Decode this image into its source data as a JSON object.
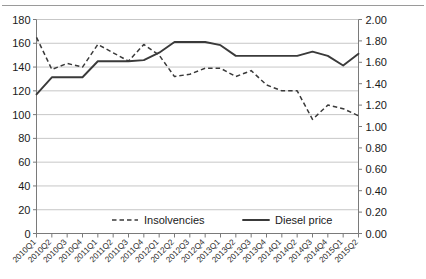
{
  "chart_data": {
    "type": "line",
    "title": "",
    "xlabel": "",
    "ylabel": "",
    "grid": true,
    "legend_position": "bottom-center",
    "categories": [
      "2010Q1",
      "2010Q2",
      "2010Q3",
      "2010Q4",
      "2011Q1",
      "2011Q2",
      "2011Q3",
      "2011Q4",
      "2012Q1",
      "2012Q2",
      "2012Q3",
      "2012Q4",
      "2013Q1",
      "2013Q2",
      "2013Q3",
      "2013Q4",
      "2014Q1",
      "2014Q2",
      "2014Q3",
      "2014Q4",
      "2015Q1",
      "2015Q2"
    ],
    "axes": {
      "left": {
        "label": "",
        "min": 0,
        "max": 180,
        "step": 20,
        "ticks": [
          "0",
          "20",
          "40",
          "60",
          "80",
          "100",
          "120",
          "140",
          "160",
          "180"
        ]
      },
      "right": {
        "label": "",
        "min": 0.0,
        "max": 2.0,
        "step": 0.2,
        "ticks": [
          "0.00",
          "0.20",
          "0.40",
          "0.60",
          "0.80",
          "1.00",
          "1.20",
          "1.40",
          "1.60",
          "1.80",
          "2.00"
        ]
      }
    },
    "series": [
      {
        "name": "Insolvencies",
        "axis": "left",
        "style": "dashed",
        "color": "#3a3a3a",
        "values": [
          165,
          138,
          143,
          140,
          159,
          152,
          145,
          159,
          150,
          132,
          134,
          139,
          139,
          132,
          137,
          125,
          120,
          120,
          96,
          108,
          105,
          99
        ]
      },
      {
        "name": "Diesel price",
        "axis": "right",
        "style": "solid",
        "color": "#3a3a3a",
        "values": [
          1.3,
          1.46,
          1.46,
          1.46,
          1.61,
          1.61,
          1.61,
          1.62,
          1.69,
          1.79,
          1.79,
          1.79,
          1.76,
          1.66,
          1.66,
          1.66,
          1.66,
          1.66,
          1.7,
          1.66,
          1.57,
          1.68
        ]
      }
    ],
    "legend": [
      {
        "label": "Insolvencies",
        "style": "dashed"
      },
      {
        "label": "Diesel price",
        "style": "solid"
      }
    ]
  }
}
